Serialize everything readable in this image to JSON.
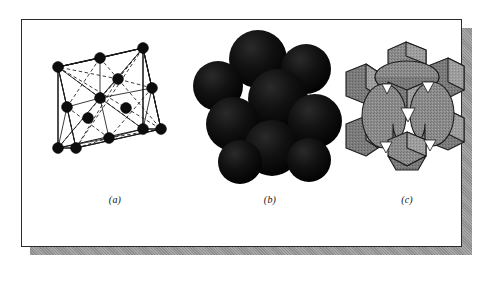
{
  "figure": {
    "name": "fcc-crystal-structure-figure",
    "background_color": "#ffffff",
    "plate_color": "#ffffff",
    "plate_border_color": "#2b2b2b",
    "shadow_color": "#9a9a9a",
    "panels": [
      {
        "id": "a",
        "caption": "(a)",
        "kind": "reduced-sphere-unit-cell",
        "description": "Face centered cubic unit cell drawn as a wire-frame cube with reduced-size atoms at the eight cube corners and at the centers of the six faces, connected by solid and dashed bond lines.",
        "atom_color": "#0d0d0d",
        "line_color": "#1a1a1a",
        "atom_count": 14,
        "corner_atoms": 8,
        "face_center_atoms": 6
      },
      {
        "id": "b",
        "caption": "(b)",
        "kind": "hard-sphere-model",
        "description": "Hard-sphere aggregate of the same face centered cubic cell; touching solid black spheres fill the cell and leave small triangular interstitial gaps.",
        "sphere_color": "#0a0a0a",
        "sphere_count": 9
      },
      {
        "id": "c",
        "caption": "(c)",
        "kind": "space-filling-polyhedra-model",
        "description": "Cut-away space filling model: gray textured truncated corner blocks and face ellipsoids showing how the spheres are clipped at the unit cell boundaries.",
        "fill_color": "#8b8b8b",
        "edge_color": "#1c1c1c",
        "highlight_color": "#a6a6a6"
      }
    ]
  }
}
